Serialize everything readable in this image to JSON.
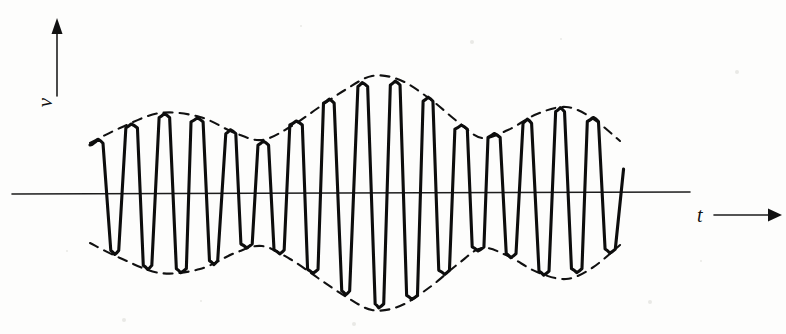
{
  "figure": {
    "background_color": "#fdfdfc",
    "ink_color": "#0d0d0d",
    "width": 786,
    "height": 334
  },
  "axes": {
    "vertical": {
      "label": "v",
      "arrow": "arrow-up",
      "x": 57,
      "top_y": 18,
      "bottom_y": 96
    },
    "horizontal": {
      "label": "t",
      "arrow": "arrow-right",
      "y": 193,
      "left_x": 12,
      "right_x": 780
    }
  },
  "chart_data": {
    "type": "line",
    "xlabel": "t",
    "ylabel": "v",
    "grid": false,
    "legend": null,
    "axis_origin_y": 193,
    "x_domain": [
      90,
      620
    ],
    "y_domain": [
      72,
      293
    ],
    "carrier": {
      "name": "carrier oscillation",
      "cycles": 16,
      "period_px": 33,
      "start_x": 90,
      "end_x": 620,
      "style": "solid-thick-hand-drawn"
    },
    "envelope": {
      "name": "beat envelope",
      "style": "dashed",
      "mirrored": true,
      "upper_points": [
        {
          "x": 90,
          "y": 143
        },
        {
          "x": 120,
          "y": 128
        },
        {
          "x": 160,
          "y": 113
        },
        {
          "x": 200,
          "y": 117
        },
        {
          "x": 235,
          "y": 133
        },
        {
          "x": 262,
          "y": 140
        },
        {
          "x": 290,
          "y": 127
        },
        {
          "x": 318,
          "y": 108
        },
        {
          "x": 345,
          "y": 90
        },
        {
          "x": 372,
          "y": 76
        },
        {
          "x": 400,
          "y": 80
        },
        {
          "x": 430,
          "y": 99
        },
        {
          "x": 458,
          "y": 122
        },
        {
          "x": 482,
          "y": 138
        },
        {
          "x": 508,
          "y": 130
        },
        {
          "x": 537,
          "y": 114
        },
        {
          "x": 566,
          "y": 107
        },
        {
          "x": 592,
          "y": 118
        },
        {
          "x": 620,
          "y": 141
        }
      ],
      "lower_points": [
        {
          "x": 90,
          "y": 243
        },
        {
          "x": 120,
          "y": 258
        },
        {
          "x": 160,
          "y": 273
        },
        {
          "x": 200,
          "y": 269
        },
        {
          "x": 235,
          "y": 253
        },
        {
          "x": 262,
          "y": 246
        },
        {
          "x": 290,
          "y": 259
        },
        {
          "x": 318,
          "y": 278
        },
        {
          "x": 345,
          "y": 296
        },
        {
          "x": 372,
          "y": 310
        },
        {
          "x": 400,
          "y": 306
        },
        {
          "x": 430,
          "y": 287
        },
        {
          "x": 458,
          "y": 264
        },
        {
          "x": 482,
          "y": 248
        },
        {
          "x": 508,
          "y": 256
        },
        {
          "x": 537,
          "y": 272
        },
        {
          "x": 566,
          "y": 279
        },
        {
          "x": 592,
          "y": 268
        },
        {
          "x": 620,
          "y": 245
        }
      ]
    }
  }
}
